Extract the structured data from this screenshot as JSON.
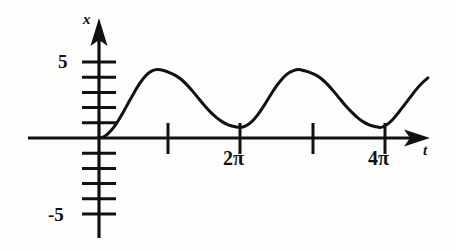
{
  "figure": {
    "kind": "mathematical-graph",
    "background_color": "#fdfdfc",
    "ink_color": "#111111"
  },
  "axes": {
    "vertical": {
      "label": "x",
      "labeled_ticks": [
        "5",
        "-5"
      ],
      "tick_label_top": "5",
      "tick_label_bottom": "-5"
    },
    "horizontal": {
      "label": "t",
      "labeled_ticks": [
        "2π",
        "4π"
      ],
      "tick_label_first": "2π",
      "tick_label_second": "4π"
    }
  },
  "chart_data": {
    "type": "line",
    "title": "",
    "xlabel": "t",
    "ylabel": "x",
    "grid": false,
    "legend": null,
    "xlim": [
      0,
      14.8
    ],
    "ylim": [
      -6.5,
      6.0
    ],
    "xticks": [
      3.1416,
      6.2832,
      9.4248,
      12.5664
    ],
    "xtick_labels": [
      "",
      "2π",
      "",
      "4π"
    ],
    "yticks": [
      -5,
      -4,
      -3,
      -2,
      -1,
      1,
      2,
      3,
      4,
      5
    ],
    "ytick_labels": [
      "-5",
      "",
      "",
      "",
      "",
      "",
      "",
      "",
      "",
      "5"
    ],
    "annotations": [
      {
        "text": "peak",
        "x": 3.1416,
        "y": 4.3
      },
      {
        "text": "cusp minimum",
        "x": 6.2832,
        "y": 0.7
      },
      {
        "text": "peak",
        "x": 9.4248,
        "y": 4.3
      },
      {
        "text": "cusp minimum",
        "x": 12.5664,
        "y": 0.7
      }
    ],
    "series": [
      {
        "name": "x(t)",
        "x": [
          0.0,
          0.26,
          0.52,
          0.79,
          1.05,
          1.31,
          1.57,
          1.83,
          2.09,
          2.36,
          2.62,
          2.88,
          3.14,
          3.4,
          3.67,
          3.93,
          4.19,
          4.45,
          4.71,
          4.97,
          5.24,
          5.5,
          5.76,
          6.02,
          6.28,
          6.54,
          6.81,
          7.07,
          7.33,
          7.59,
          7.85,
          8.12,
          8.38,
          8.64,
          8.9,
          9.16,
          9.42,
          9.69,
          9.95,
          10.21,
          10.47,
          10.73,
          10.99,
          11.26,
          11.52,
          11.78,
          12.04,
          12.3,
          12.57,
          12.83,
          13.09,
          13.35,
          13.61,
          13.88,
          14.14,
          14.4,
          14.66
        ],
        "y": [
          0.0,
          0.12,
          0.46,
          0.98,
          1.62,
          2.32,
          3.0,
          3.62,
          4.11,
          4.42,
          4.5,
          4.44,
          4.3,
          4.12,
          3.85,
          3.48,
          3.05,
          2.58,
          2.12,
          1.7,
          1.34,
          1.06,
          0.87,
          0.76,
          0.7,
          0.8,
          1.08,
          1.52,
          2.08,
          2.7,
          3.3,
          3.82,
          4.2,
          4.42,
          4.5,
          4.42,
          4.3,
          4.12,
          3.85,
          3.48,
          3.05,
          2.58,
          2.12,
          1.7,
          1.34,
          1.06,
          0.87,
          0.76,
          0.7,
          0.88,
          1.22,
          1.68,
          2.18,
          2.7,
          3.2,
          3.62,
          3.95
        ]
      }
    ]
  }
}
